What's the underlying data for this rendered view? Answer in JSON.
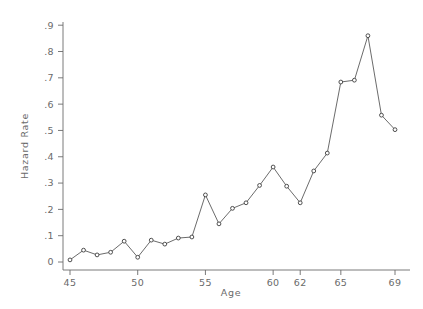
{
  "chart_data": {
    "type": "line",
    "title": "",
    "xlabel": "Age",
    "ylabel": "Hazard Rate",
    "xlim": [
      44.6,
      69.4
    ],
    "ylim": [
      -0.02,
      0.94
    ],
    "grid": false,
    "legend": false,
    "marker": "open-circle",
    "x_tick_labels": [
      "45",
      "50",
      "55",
      "60",
      "62",
      "65",
      "69"
    ],
    "x_tick_values": [
      45,
      50,
      55,
      60,
      62,
      65,
      69
    ],
    "y_tick_labels": [
      "0",
      ".1",
      ".2",
      ".3",
      ".4",
      ".5",
      ".6",
      ".7",
      ".8",
      ".9"
    ],
    "y_tick_values": [
      0,
      0.1,
      0.2,
      0.3,
      0.4,
      0.5,
      0.6,
      0.7,
      0.8,
      0.9
    ],
    "x": [
      45,
      46,
      47,
      48,
      49,
      50,
      51,
      52,
      53,
      54,
      55,
      56,
      57,
      58,
      59,
      60,
      61,
      62,
      63,
      64,
      65,
      66,
      67,
      68,
      69
    ],
    "values": [
      0.008,
      0.045,
      0.027,
      0.037,
      0.079,
      0.018,
      0.083,
      0.068,
      0.091,
      0.095,
      0.255,
      0.145,
      0.204,
      0.225,
      0.291,
      0.361,
      0.288,
      0.225,
      0.346,
      0.414,
      0.684,
      0.691,
      0.86,
      0.558,
      0.503
    ],
    "series": [
      {
        "name": "Hazard Rate",
        "values": [
          0.008,
          0.045,
          0.027,
          0.037,
          0.079,
          0.018,
          0.083,
          0.068,
          0.091,
          0.095,
          0.255,
          0.145,
          0.204,
          0.225,
          0.291,
          0.361,
          0.288,
          0.225,
          0.346,
          0.414,
          0.684,
          0.691,
          0.86,
          0.558,
          0.503
        ],
        "color": "#5a5a5a"
      }
    ]
  },
  "colors": {
    "line": "#5a5a5a",
    "axis": "#6b6b6b",
    "text": "#6a6a6a",
    "marker_fill": "#ffffff",
    "marker_stroke": "#3c3c3c",
    "background": "#ffffff"
  }
}
